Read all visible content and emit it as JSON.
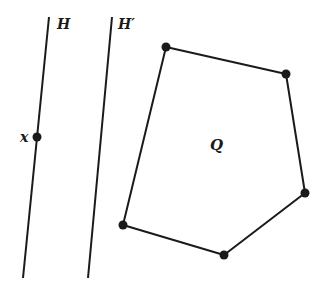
{
  "diagram": {
    "lines": [
      {
        "id": "H",
        "label": "H",
        "x1": 49,
        "y1": 17,
        "x2": 23,
        "y2": 278,
        "label_x": 57,
        "label_y": 29
      },
      {
        "id": "H_prime",
        "label": "H′",
        "x1": 112,
        "y1": 17,
        "x2": 88,
        "y2": 278,
        "label_x": 118,
        "label_y": 29
      }
    ],
    "point_x": {
      "label": "x",
      "cx": 37,
      "cy": 137,
      "label_x": 20,
      "label_y": 142
    },
    "polygon": {
      "label": "Q",
      "label_x": 210,
      "label_y": 150,
      "vertices": [
        [
          166,
          47
        ],
        [
          286,
          74
        ],
        [
          305,
          193
        ],
        [
          224,
          255
        ],
        [
          123,
          225
        ]
      ]
    },
    "colors": {
      "stroke": "#1a1a1a",
      "background": "#ffffff"
    }
  }
}
